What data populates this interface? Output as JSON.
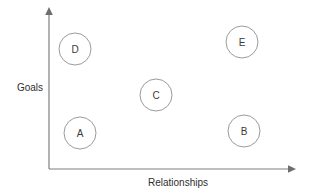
{
  "diagram": {
    "background_color": "#ffffff",
    "axes": {
      "x": {
        "label": "Relationships",
        "origin_x": 49,
        "origin_y": 169,
        "end_x": 295,
        "label_x": 178,
        "label_y": 186,
        "color": "#7f7f7f",
        "arrow": "arrow-right"
      },
      "y": {
        "label": "Goals",
        "origin_x": 49,
        "origin_y": 169,
        "end_y": 10,
        "label_x": 43,
        "label_y": 91,
        "color": "#7f7f7f",
        "arrow": "arrow-up"
      }
    },
    "nodes": [
      {
        "id": "node-d",
        "label": "D",
        "cx": 75,
        "cy": 49,
        "r": 16,
        "stroke": "#9b9b9b",
        "fill": "#ffffff"
      },
      {
        "id": "node-e",
        "label": "E",
        "cx": 242,
        "cy": 42,
        "r": 16,
        "stroke": "#9b9b9b",
        "fill": "#ffffff"
      },
      {
        "id": "node-c",
        "label": "C",
        "cx": 156,
        "cy": 95,
        "r": 16,
        "stroke": "#9b9b9b",
        "fill": "#ffffff"
      },
      {
        "id": "node-a",
        "label": "A",
        "cx": 80,
        "cy": 133,
        "r": 16,
        "stroke": "#9b9b9b",
        "fill": "#ffffff"
      },
      {
        "id": "node-b",
        "label": "B",
        "cx": 244,
        "cy": 131,
        "r": 16,
        "stroke": "#9b9b9b",
        "fill": "#ffffff"
      }
    ]
  },
  "chart_data": {
    "type": "scatter",
    "title": "",
    "xlabel": "Relationships",
    "ylabel": "Goals",
    "xlim": [
      0,
      100
    ],
    "ylim": [
      0,
      100
    ],
    "grid": false,
    "legend": "none",
    "point_labels": [
      "A",
      "B",
      "C",
      "D",
      "E"
    ],
    "points": [
      {
        "label": "A",
        "x": 13,
        "y": 23
      },
      {
        "label": "B",
        "x": 79,
        "y": 24
      },
      {
        "label": "C",
        "x": 44,
        "y": 47
      },
      {
        "label": "D",
        "x": 11,
        "y": 75
      },
      {
        "label": "E",
        "x": 78,
        "y": 80
      }
    ]
  }
}
